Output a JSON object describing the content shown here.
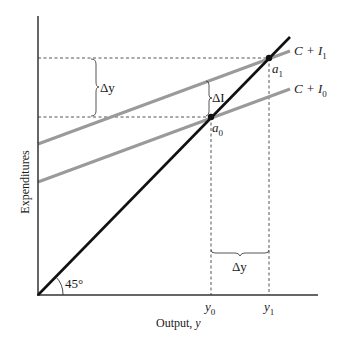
{
  "diagram": {
    "type": "keynesian-cross",
    "axes": {
      "x_label": "Output, ",
      "x_label_var": "y",
      "y_label": "Expenditures",
      "origin_angle_label": "45°"
    },
    "lines": {
      "line_45": {
        "color": "#111111"
      },
      "c_i1": {
        "label_base": "C + I",
        "label_sub": "1",
        "color": "#999999"
      },
      "c_i0": {
        "label_base": "C + I",
        "label_sub": "0",
        "color": "#999999"
      }
    },
    "points": {
      "a0": {
        "base": "a",
        "sub": "0"
      },
      "a1": {
        "base": "a",
        "sub": "1"
      }
    },
    "ticks": {
      "y0": {
        "base": "y",
        "sub": "0"
      },
      "y1": {
        "base": "y",
        "sub": "1"
      }
    },
    "annotations": {
      "delta_y_vertical": "Δy",
      "delta_i": "ΔI",
      "delta_y_horizontal": "Δy"
    }
  }
}
